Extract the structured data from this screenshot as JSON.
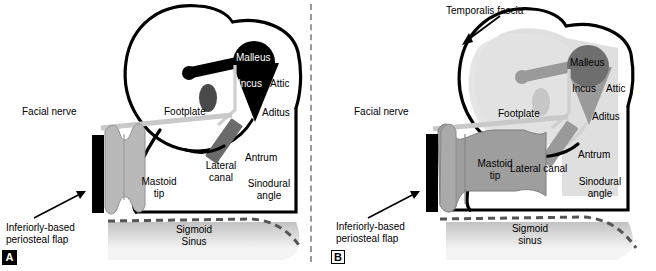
{
  "figure": {
    "type": "anatomical-diagram",
    "panel_count": 2,
    "divider": "vertical-dashed-line"
  },
  "colors": {
    "outline": "#000000",
    "dark_structure": "#000000",
    "mid_gray": "#6e6e6e",
    "light_gray": "#b8b8b8",
    "pale_gray": "#d9d9d9",
    "fascia_overlay": "#dcdcdc",
    "sinus_gray": "#cccccc",
    "divider_gray": "#9a9a9a",
    "white": "#ffffff"
  },
  "panel_a": {
    "tag": "A",
    "labels": {
      "facial_nerve": "Facial nerve",
      "footplate": "Footplate",
      "malleus": "Malleus",
      "incus": "Incus",
      "attic": "Attic",
      "aditus": "Aditus",
      "antrum": "Antrum",
      "lateral_canal_line1": "Lateral",
      "lateral_canal_line2": "canal",
      "sinodural_line1": "Sinodural",
      "sinodural_line2": "angle",
      "mastoid_line1": "Mastoid",
      "mastoid_line2": "tip",
      "sigmoid_line1": "Sigmoid",
      "sigmoid_line2": "Sinus",
      "periosteal_line1": "Inferiorly-based",
      "periosteal_line2": "periosteal flap"
    },
    "structures": [
      "mastoid-cavity-outline",
      "attic-lobe",
      "malleus-head",
      "malleus-handle",
      "incus-triangle",
      "footplate-ellipse",
      "lateral-canal-bar",
      "facial-nerve-strip",
      "periosteal-flap-bar",
      "mastoid-tip-wavy-flap",
      "sigmoid-sinus-mass"
    ],
    "annotations": [
      "periosteal-flap-arrow"
    ]
  },
  "panel_b": {
    "tag": "B",
    "labels": {
      "temporalis_fascia": "Temporalis fascia",
      "facial_nerve": "Facial nerve",
      "footplate": "Footplate",
      "malleus": "Malleus",
      "incus": "Incus",
      "attic": "Attic",
      "aditus": "Aditus",
      "antrum": "Antrum",
      "lateral_canal": "Lateral canal",
      "sinodural_line1": "Sinodural",
      "sinodural_line2": "angle",
      "mastoid_line1": "Mastoid",
      "mastoid_line2": "tip",
      "sigmoid_line1": "Sigmoid",
      "sigmoid_line2": "sinus",
      "periosteal_line1": "Inferiorly-based",
      "periosteal_line2": "periosteal flap"
    },
    "structures": [
      "mastoid-cavity-outline",
      "attic-lobe",
      "temporalis-fascia-overlay",
      "malleus-head",
      "malleus-handle",
      "incus-triangle",
      "footplate-ellipse",
      "lateral-canal-bar",
      "facial-nerve-strip",
      "periosteal-flap-bar",
      "mastoid-tip-flap",
      "sigmoid-sinus-mass"
    ],
    "annotations": [
      "temporalis-fascia-arrow",
      "periosteal-flap-arrow"
    ]
  }
}
